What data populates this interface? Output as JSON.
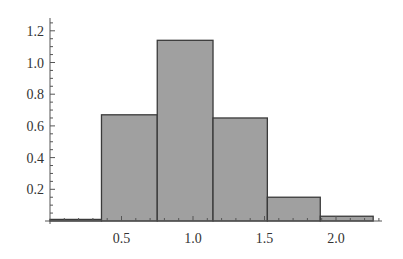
{
  "chart_data": {
    "type": "bar",
    "subtype": "histogram",
    "title": "",
    "xlabel": "",
    "ylabel": "",
    "bins": [
      {
        "start": 0.0,
        "end": 0.36,
        "value": 0.01
      },
      {
        "start": 0.36,
        "end": 0.75,
        "value": 0.67
      },
      {
        "start": 0.75,
        "end": 1.14,
        "value": 1.14
      },
      {
        "start": 1.14,
        "end": 1.52,
        "value": 0.65
      },
      {
        "start": 1.52,
        "end": 1.89,
        "value": 0.15
      },
      {
        "start": 1.89,
        "end": 2.26,
        "value": 0.03
      }
    ],
    "categories": [
      "0.0-0.36",
      "0.36-0.75",
      "0.75-1.14",
      "1.14-1.52",
      "1.52-1.89",
      "1.89-2.26"
    ],
    "values": [
      0.01,
      0.67,
      1.14,
      0.65,
      0.15,
      0.03
    ],
    "xticks": [
      "0.5",
      "1.0",
      "1.5",
      "2.0"
    ],
    "xtick_values": [
      0.5,
      1.0,
      1.5,
      2.0
    ],
    "yticks": [
      "0.2",
      "0.4",
      "0.6",
      "0.8",
      "1.0",
      "1.2"
    ],
    "ytick_values": [
      0.2,
      0.4,
      0.6,
      0.8,
      1.0,
      1.2
    ],
    "xlim": [
      0,
      2.3
    ],
    "ylim": [
      0,
      1.27
    ],
    "grid": false,
    "legend": null,
    "colors": {
      "bar_fill": "#a0a0a0",
      "bar_edge": "#3a3a3a",
      "axis": "#555555"
    }
  },
  "layout": {
    "origin_x": 50,
    "origin_y": 221,
    "px_per_x": 143,
    "px_per_y": 158.5,
    "x_axis_end": 382,
    "y_axis_top": 18
  }
}
